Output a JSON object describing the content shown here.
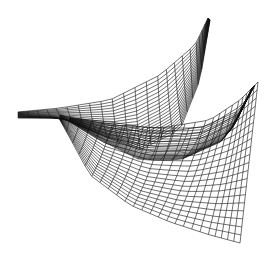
{
  "figure": {
    "background": "#ffffff",
    "line_color": "#111111",
    "width": 272,
    "height": 262
  },
  "patches": [
    {
      "name": "upper-wing",
      "rows": 20,
      "cols": 22,
      "edges": {
        "a": [
          [
            18,
            112
          ],
          [
            60,
            108
          ],
          [
            110,
            100
          ],
          [
            160,
            75
          ],
          [
            195,
            45
          ],
          [
            208,
            18
          ]
        ],
        "b": [
          [
            18,
            118
          ],
          [
            62,
            118
          ],
          [
            100,
            135
          ],
          [
            140,
            150
          ],
          [
            180,
            130
          ],
          [
            200,
            80
          ],
          [
            210,
            20
          ]
        ]
      }
    },
    {
      "name": "lower-wing",
      "rows": 20,
      "cols": 24,
      "edges": {
        "a": [
          [
            60,
            115
          ],
          [
            110,
            125
          ],
          [
            160,
            128
          ],
          [
            210,
            120
          ],
          [
            240,
            100
          ],
          [
            258,
            82
          ]
        ],
        "b": [
          [
            60,
            120
          ],
          [
            90,
            175
          ],
          [
            130,
            205
          ],
          [
            170,
            222
          ],
          [
            210,
            235
          ],
          [
            240,
            243
          ]
        ]
      }
    },
    {
      "name": "back-sheet",
      "rows": 18,
      "cols": 18,
      "edges": {
        "a": [
          [
            70,
            118
          ],
          [
            110,
            122
          ],
          [
            150,
            128
          ],
          [
            200,
            128
          ],
          [
            240,
            110
          ],
          [
            255,
            85
          ]
        ],
        "b": [
          [
            70,
            122
          ],
          [
            100,
            140
          ],
          [
            140,
            160
          ],
          [
            180,
            160
          ],
          [
            225,
            140
          ],
          [
            252,
            88
          ]
        ]
      }
    }
  ]
}
